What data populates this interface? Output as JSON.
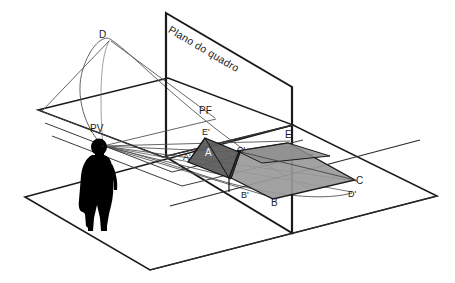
{
  "figure": {
    "kind": "technical-perspective-diagram",
    "language": "pt-BR",
    "title_text": "Plano do quadro",
    "background_color": "#ffffff",
    "line_color": "#1a1a1a",
    "thin_line_color": "#555555",
    "silhouette_color": "#000000",
    "fill_dark": "#606060",
    "fill_light": "#9a9a9a"
  },
  "labels": {
    "picture_plane": "Plano do quadro",
    "viewpoint": "PV",
    "vanishing_point": "PF",
    "object_d": "D",
    "object_e_prime": "E'",
    "object_a_prime": "A'",
    "object_a": "A",
    "object_c_prime": "C'",
    "object_e": "E",
    "object_b_prime": "B'",
    "object_b": "B",
    "object_c": "C",
    "object_d_prime": "D'"
  },
  "geometry": {
    "picture_plane": {
      "top_left": [
        166,
        13
      ],
      "top_right": [
        292,
        87
      ],
      "bottom_right": [
        292,
        233
      ],
      "bottom_left": [
        166,
        157
      ]
    },
    "ground_plane": {
      "left": [
        25,
        197
      ],
      "top": [
        293,
        125
      ],
      "right": [
        437,
        196
      ],
      "bottom": [
        150,
        270
      ]
    },
    "horizon_plane": {
      "left": [
        38,
        110
      ],
      "top": [
        168,
        78
      ],
      "right": [
        293,
        125
      ],
      "bottom": [
        163,
        157
      ]
    },
    "viewpoint_xy": [
      103,
      146
    ],
    "vanishing_point_xy": [
      216,
      119
    ],
    "shape_projected": [
      [
        205,
        138
      ],
      [
        188,
        162
      ],
      [
        229,
        178
      ],
      [
        239,
        152
      ]
    ],
    "shape_object": [
      [
        288,
        143
      ],
      [
        237,
        151
      ],
      [
        231,
        178
      ],
      [
        273,
        199
      ],
      [
        355,
        180
      ]
    ]
  }
}
